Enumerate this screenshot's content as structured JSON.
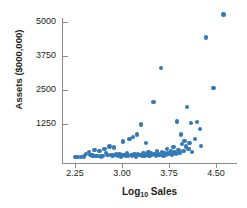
{
  "chart_data": {
    "type": "scatter",
    "title": "",
    "xlabel": "Log10 Sales",
    "ylabel": "Assets ($000,000)",
    "xlabel_base": "Log",
    "xlabel_sub": "10",
    "xlabel_rest": " Sales",
    "xlim": [
      2.1,
      4.72
    ],
    "ylim": [
      0,
      5450
    ],
    "xticks": [
      2.25,
      3.0,
      3.75,
      4.5
    ],
    "xtick_labels": [
      "2.25",
      "3.00",
      "3.75",
      "4.50"
    ],
    "yticks": [
      1250,
      2500,
      3750,
      5000
    ],
    "ytick_labels": [
      "1250",
      "2500",
      "3750",
      "5000"
    ],
    "grid": false,
    "legend": "none",
    "marker_color": "#3279b7",
    "axis_color": "#8a8a8a",
    "text_color": "#231f20",
    "points": [
      [
        2.26,
        30
      ],
      [
        2.3,
        35
      ],
      [
        2.35,
        40
      ],
      [
        2.39,
        60
      ],
      [
        2.43,
        150
      ],
      [
        2.47,
        210
      ],
      [
        2.5,
        120
      ],
      [
        2.53,
        90
      ],
      [
        2.56,
        300
      ],
      [
        2.58,
        70
      ],
      [
        2.61,
        65
      ],
      [
        2.64,
        260
      ],
      [
        2.66,
        60
      ],
      [
        2.69,
        80
      ],
      [
        2.72,
        320
      ],
      [
        2.74,
        180
      ],
      [
        2.77,
        120
      ],
      [
        2.8,
        420
      ],
      [
        2.82,
        100
      ],
      [
        2.85,
        90
      ],
      [
        2.87,
        390
      ],
      [
        2.9,
        130
      ],
      [
        2.92,
        110
      ],
      [
        2.94,
        75
      ],
      [
        2.96,
        140
      ],
      [
        2.98,
        60
      ],
      [
        3.0,
        95
      ],
      [
        3.02,
        600
      ],
      [
        3.04,
        110
      ],
      [
        3.06,
        80
      ],
      [
        3.08,
        160
      ],
      [
        3.1,
        70
      ],
      [
        3.12,
        700
      ],
      [
        3.14,
        120
      ],
      [
        3.16,
        90
      ],
      [
        3.18,
        780
      ],
      [
        3.2,
        130
      ],
      [
        3.22,
        60
      ],
      [
        3.24,
        870
      ],
      [
        3.26,
        150
      ],
      [
        3.28,
        100
      ],
      [
        3.3,
        1230
      ],
      [
        3.32,
        95
      ],
      [
        3.34,
        180
      ],
      [
        3.36,
        70
      ],
      [
        3.38,
        560
      ],
      [
        3.4,
        120
      ],
      [
        3.42,
        200
      ],
      [
        3.44,
        90
      ],
      [
        3.46,
        160
      ],
      [
        3.48,
        110
      ],
      [
        3.5,
        2060
      ],
      [
        3.52,
        140
      ],
      [
        3.54,
        80
      ],
      [
        3.56,
        250
      ],
      [
        3.58,
        130
      ],
      [
        3.6,
        100
      ],
      [
        3.62,
        3300
      ],
      [
        3.64,
        210
      ],
      [
        3.66,
        90
      ],
      [
        3.68,
        160
      ],
      [
        3.7,
        120
      ],
      [
        3.72,
        330
      ],
      [
        3.74,
        180
      ],
      [
        3.76,
        140
      ],
      [
        3.78,
        260
      ],
      [
        3.8,
        110
      ],
      [
        3.82,
        400
      ],
      [
        3.84,
        200
      ],
      [
        3.86,
        150
      ],
      [
        3.88,
        1340
      ],
      [
        3.9,
        300
      ],
      [
        3.92,
        180
      ],
      [
        3.94,
        860
      ],
      [
        3.96,
        520
      ],
      [
        3.98,
        250
      ],
      [
        4.0,
        620
      ],
      [
        4.02,
        420
      ],
      [
        4.04,
        1870
      ],
      [
        4.06,
        330
      ],
      [
        4.08,
        560
      ],
      [
        4.1,
        1280
      ],
      [
        4.12,
        210
      ],
      [
        4.16,
        700
      ],
      [
        4.2,
        1330
      ],
      [
        4.24,
        1060
      ],
      [
        4.26,
        450
      ],
      [
        4.34,
        4430
      ],
      [
        4.46,
        2580
      ],
      [
        4.62,
        5280
      ]
    ]
  }
}
